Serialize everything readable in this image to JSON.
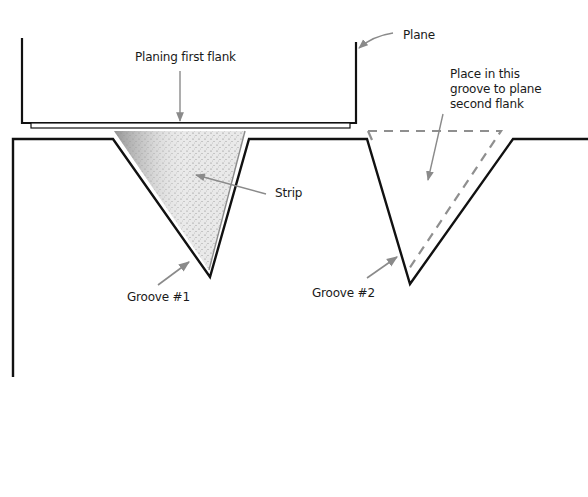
{
  "diagram": {
    "labels": {
      "plane": "Plane",
      "planing_first_flank": "Planing first flank",
      "place_in_groove": "Place in this\ngroove to plane\nsecond flank",
      "strip": "Strip",
      "groove_1": "Groove #1",
      "groove_2": "Groove #2"
    },
    "colors": {
      "line": "#111111",
      "arrow": "#8a8a8a",
      "strip_fill": "#d8d8d8",
      "strip_shade": "#9a9a9a",
      "dashed_outline": "#8f8f8f",
      "background": "#ffffff"
    }
  }
}
